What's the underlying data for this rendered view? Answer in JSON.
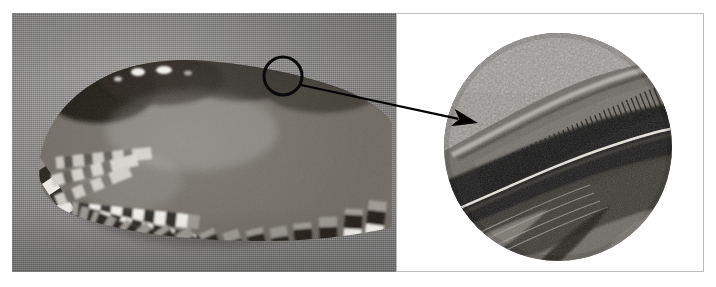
{
  "figure": {
    "type": "scientific-photograph-figure",
    "title": "Owl wing with magnified detail of leading-edge feather serrations",
    "background_color": "#ffffff",
    "panel_count": 2
  },
  "left_panel": {
    "name": "wing-photograph",
    "description": "Grayscale photograph of a folded owl wing resting on a grey textured cloth background, showing barred (checkered) flight feather plumage.",
    "subject": "owl wing",
    "background_color": "#8c8b89",
    "plumage_pattern": "barred",
    "region_of_interest": {
      "shape": "circle",
      "center_x": 283,
      "center_y": 76,
      "radius": 19,
      "stroke_color": "#0a0a0a",
      "stroke_width": 3,
      "label": "leading-edge detail"
    }
  },
  "callout": {
    "name": "leader-arrow",
    "from_x": 301,
    "from_y": 85,
    "to_x": 478,
    "to_y": 123,
    "color": "#000000",
    "line_width": 2.2,
    "arrowhead": "solid-barbed"
  },
  "right_panel": {
    "name": "magnified-detail",
    "description": "Circular close-up inset showing the comb-like serrations along the leading edge of the outermost primary feather, with velvety down above and smooth feather vanes below.",
    "background_color": "#ffffff",
    "border_color": "#bdbdbd",
    "circle": {
      "center_x": 557,
      "center_y": 146,
      "radius": 114
    },
    "features": [
      "velvety down surface",
      "comb-like leading-edge serrations",
      "feather rachis",
      "overlapping feather vanes"
    ]
  },
  "colors": {
    "photo_grey": "#8c8b89",
    "dark_feather": "#23211f",
    "light_feather": "#e9e7e2",
    "ink_black": "#000000",
    "card_white": "#ffffff",
    "card_border": "#bdbdbd"
  }
}
